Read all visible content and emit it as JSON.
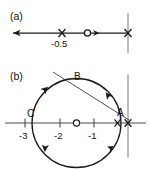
{
  "figure": {
    "background_color": "#ffffff",
    "locus_color": "#1a1a1a",
    "axis_color": "#4d4d4d",
    "guide_color": "#9a9a9a"
  },
  "panels": [
    {
      "id": "a",
      "label": "(a)",
      "axis": {
        "type": "real-axis",
        "x_from": -3.3,
        "x_to": 0.35,
        "arrow": "left"
      },
      "markers": [
        {
          "kind": "pole",
          "glyph": "x",
          "label": "-0.5",
          "x": -0.5,
          "y": 0
        },
        {
          "kind": "zero",
          "glyph": "o",
          "label": "",
          "x": -0.18,
          "y": 0
        },
        {
          "kind": "pole",
          "glyph": "x",
          "label": "",
          "x": 0.0,
          "y": 0
        }
      ],
      "tick_labels": [
        {
          "text": "-0.5",
          "x": -0.5
        }
      ],
      "guides": [
        {
          "kind": "vertical-line",
          "x": 0.0
        }
      ],
      "branch_arrows": [
        {
          "direction": "left",
          "x": -2.9
        },
        {
          "direction": "left",
          "x": -0.32
        }
      ]
    },
    {
      "id": "b",
      "label": "(b)",
      "axis": {
        "type": "real-axis",
        "x_from": -3.35,
        "x_to": 0.35,
        "arrow": "none"
      },
      "tick_labels": [
        {
          "text": "-3",
          "x": -3
        },
        {
          "text": "-2",
          "x": -2
        },
        {
          "text": "-1",
          "x": -1
        }
      ],
      "markers": [
        {
          "kind": "zero",
          "glyph": "o",
          "label": "",
          "x": -1.5,
          "y": 0
        },
        {
          "kind": "pole",
          "glyph": "x",
          "label": "",
          "x": -0.28,
          "y": 0
        },
        {
          "kind": "pole",
          "glyph": "x",
          "label": "",
          "x": 0.0,
          "y": 0
        }
      ],
      "points": [
        {
          "name": "A",
          "x": -0.02,
          "y": 0.28
        },
        {
          "name": "B",
          "x": -1.35,
          "y": 1.42
        },
        {
          "name": "C",
          "x": -2.78,
          "y": 0.22
        }
      ],
      "locus": {
        "shape": "circle",
        "center_x": -1.5,
        "center_y": 0,
        "radius": 1.28,
        "arrow_count": 4
      },
      "guides": [
        {
          "kind": "vertical-line",
          "x": 0.0
        },
        {
          "kind": "asymptote-line",
          "from_x": -2.6,
          "from_y": 1.9,
          "to_x": 0.05,
          "to_y": 0.1
        }
      ]
    }
  ]
}
